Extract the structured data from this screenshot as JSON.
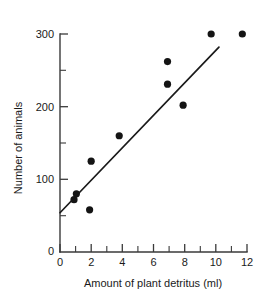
{
  "chart_data": {
    "type": "scatter",
    "title": "",
    "subtitle": "",
    "xlabel": "Amount of plant detritus (ml)",
    "ylabel": "Number of animals",
    "xlim": [
      0,
      12
    ],
    "ylim": [
      0,
      300
    ],
    "grid": false,
    "legend": null,
    "x_ticks": [
      0,
      2,
      4,
      6,
      8,
      10,
      12
    ],
    "x_tick_labels": [
      "0",
      "2",
      "4",
      "6",
      "8",
      "10",
      "12"
    ],
    "x_minor_ticks": [
      1,
      3,
      5,
      7,
      9,
      11
    ],
    "y_ticks": [
      0,
      100,
      200,
      300
    ],
    "y_tick_labels": [
      "0",
      "100",
      "200",
      "300"
    ],
    "y_minor_ticks": [
      50,
      150,
      250
    ],
    "point_color": "#141414",
    "line_color": "#1a1a1a",
    "axis_color": "#3a3a3a",
    "points": [
      {
        "x": 0.9,
        "y": 72
      },
      {
        "x": 1.05,
        "y": 80
      },
      {
        "x": 1.9,
        "y": 58
      },
      {
        "x": 2.0,
        "y": 125
      },
      {
        "x": 3.8,
        "y": 160
      },
      {
        "x": 6.9,
        "y": 262
      },
      {
        "x": 6.9,
        "y": 231
      },
      {
        "x": 7.9,
        "y": 202
      },
      {
        "x": 9.7,
        "y": 300
      },
      {
        "x": 11.7,
        "y": 300
      }
    ],
    "trend_line": {
      "x0": 0.0,
      "y0": 54,
      "x1": 10.2,
      "y1": 282
    }
  },
  "axis_titles": {
    "x": "Amount of plant detritus (ml)",
    "y": "Number of animals"
  }
}
